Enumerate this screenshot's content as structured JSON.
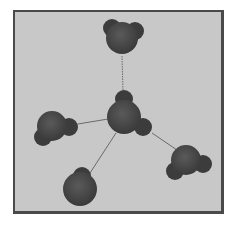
{
  "diagram": {
    "title": "",
    "background_color": "#c8c8c8",
    "border_color": "#4a4a4a",
    "atom_color": "#4a4a4a",
    "bond_color": "#6a6a6a",
    "molecules": [
      {
        "id": "center",
        "oxygen": {
          "x": 124,
          "y": 117,
          "r": 17
        },
        "hydrogens": [
          {
            "x": 124,
            "y": 99,
            "r": 9
          },
          {
            "x": 143,
            "y": 127,
            "r": 9
          }
        ]
      },
      {
        "id": "top",
        "oxygen": {
          "x": 122,
          "y": 38,
          "r": 16
        },
        "hydrogens": [
          {
            "x": 112,
            "y": 28,
            "r": 9
          },
          {
            "x": 135,
            "y": 31,
            "r": 9
          }
        ]
      },
      {
        "id": "left",
        "oxygen": {
          "x": 52,
          "y": 126,
          "r": 15
        },
        "hydrogens": [
          {
            "x": 69,
            "y": 127,
            "r": 9
          },
          {
            "x": 43,
            "y": 137,
            "r": 9
          }
        ]
      },
      {
        "id": "right",
        "oxygen": {
          "x": 186,
          "y": 160,
          "r": 15
        },
        "hydrogens": [
          {
            "x": 203,
            "y": 164,
            "r": 9
          },
          {
            "x": 175,
            "y": 171,
            "r": 9
          }
        ]
      },
      {
        "id": "bottom",
        "oxygen": {
          "x": 80,
          "y": 189,
          "r": 17
        },
        "hydrogens": [
          {
            "x": 82,
            "y": 176,
            "r": 9
          }
        ]
      }
    ],
    "bonds": [
      {
        "from": "center",
        "to": "top",
        "x1": 122,
        "y1": 56,
        "x2": 123,
        "y2": 91,
        "style": "dotted"
      },
      {
        "from": "center",
        "to": "left",
        "x1": 78,
        "y1": 124,
        "x2": 108,
        "y2": 119,
        "style": "solid"
      },
      {
        "from": "center",
        "to": "right",
        "x1": 152,
        "y1": 133,
        "x2": 177,
        "y2": 150,
        "style": "solid"
      },
      {
        "from": "center",
        "to": "bottom",
        "x1": 116,
        "y1": 133,
        "x2": 90,
        "y2": 173,
        "style": "solid"
      }
    ]
  }
}
